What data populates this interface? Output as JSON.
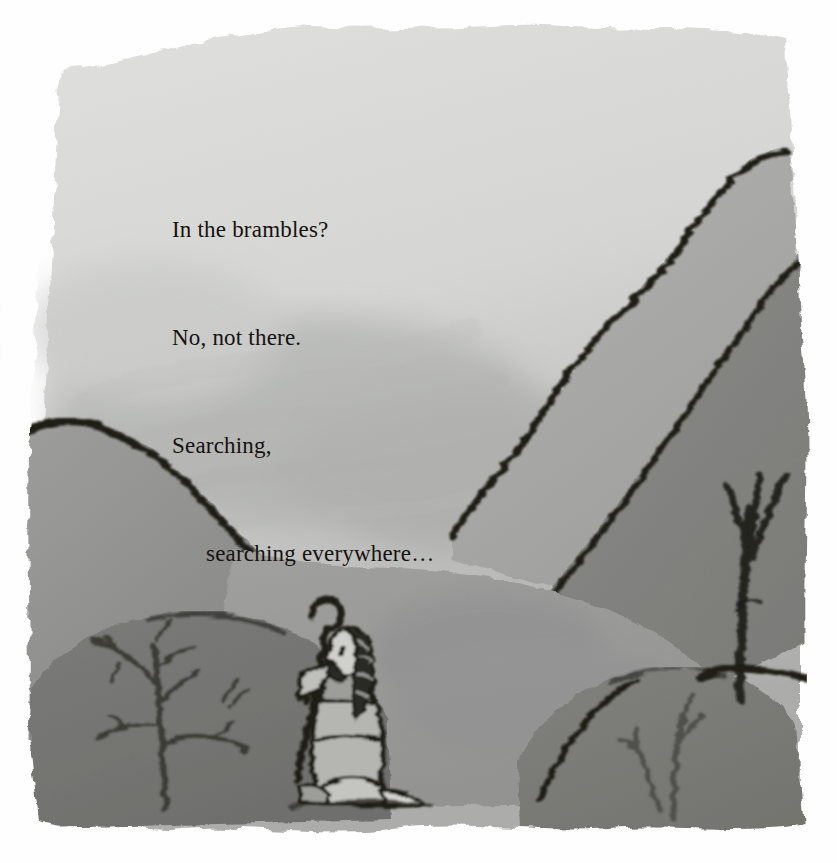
{
  "page": {
    "kind": "illustrated-storybook-page",
    "width": 837,
    "height": 863,
    "background_color": "#ffffff",
    "media": "painted gouache illustration with black ink outlines, grayscale"
  },
  "verse": {
    "lines": [
      {
        "text": "In the brambles?",
        "indent": false
      },
      {
        "text": "No, not there.",
        "indent": false
      },
      {
        "text": "Searching,",
        "indent": false
      },
      {
        "text": "searching everywhere…",
        "indent": true
      }
    ],
    "color": "#15120f"
  },
  "scene": {
    "title": "Shepherd kneeling and searching among hills and brambles",
    "elements": [
      {
        "name": "sky",
        "description": "pale washed grey sky filling the upper area",
        "color": "#d7d8d6"
      },
      {
        "name": "sky-shadow",
        "description": "darker grey brushed shadow across lower sky",
        "color": "#b9bab8"
      },
      {
        "name": "hill-left",
        "description": "large mid-grey hill rising from left edge",
        "color": "#8f8f8d"
      },
      {
        "name": "hill-right-far",
        "description": "pale grey distant hill on the right",
        "color": "#a6a6a4"
      },
      {
        "name": "hill-right-near",
        "description": "darker grey hill on the right with black outline",
        "color": "#7e7e7c"
      },
      {
        "name": "hill-centre",
        "description": "mid-grey ground the shepherd kneels on",
        "color": "#959593"
      },
      {
        "name": "mound-left-foreground",
        "description": "dark foreground bramble mound, bottom left",
        "color": "#6e6e6c"
      },
      {
        "name": "mound-right-foreground",
        "description": "dark foreground bramble mound, bottom right",
        "color": "#74746f"
      },
      {
        "name": "tree",
        "description": "bare tree with three branches on the right slope",
        "color": "#1a1a18"
      },
      {
        "name": "bramble-left",
        "description": "bare branching bramble bush, bottom left",
        "color": "#34342f"
      },
      {
        "name": "bramble-right",
        "description": "bare branching bramble twigs, bottom right",
        "color": "#4a4a45"
      },
      {
        "name": "shepherd",
        "description": "kneeling bearded shepherd in robe holding a crook",
        "color": "#1a1a18"
      },
      {
        "name": "crook",
        "description": "shepherd's curved staff leaning to the left",
        "color": "#17170f"
      }
    ],
    "outline_color": "#16160f",
    "torn_edge": "rough hand-painted edges on all four sides against white paper"
  }
}
